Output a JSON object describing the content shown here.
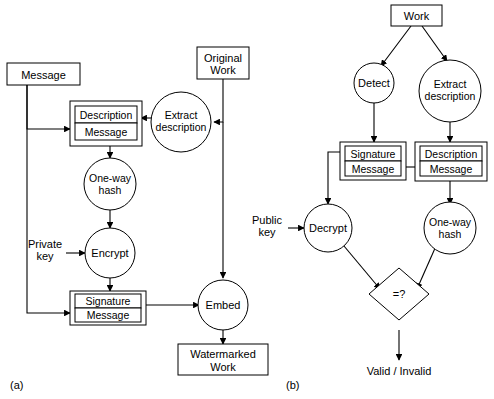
{
  "figure": {
    "title_present": false,
    "background_color": "#ffffff",
    "line_color": "#000000",
    "panels": [
      {
        "id": "a",
        "caption": "(a)",
        "name": "watermark-embedding-diagram",
        "nodes": {
          "message": "Message",
          "original_work": "Original\nWork",
          "original_work_line1": "Original",
          "original_work_line2": "Work",
          "extract_description_line1": "Extract",
          "extract_description_line2": "description",
          "description_message_top": "Description",
          "description_message_bottom": "Message",
          "one_way_hash_line1": "One-way",
          "one_way_hash_line2": "hash",
          "private_key_line1": "Private",
          "private_key_line2": "key",
          "encrypt": "Encrypt",
          "signature_message_top": "Signature",
          "signature_message_bottom": "Message",
          "embed": "Embed",
          "watermarked_work_line1": "Watermarked",
          "watermarked_work_line2": "Work"
        }
      },
      {
        "id": "b",
        "caption": "(b)",
        "name": "watermark-verification-diagram",
        "nodes": {
          "work": "Work",
          "detect": "Detect",
          "extract_description_line1": "Extract",
          "extract_description_line2": "description",
          "signature_message_top": "Signature",
          "signature_message_bottom": "Message",
          "description_message_top": "Description",
          "description_message_bottom": "Message",
          "public_key_line1": "Public",
          "public_key_line2": "key",
          "decrypt": "Decrypt",
          "one_way_hash_line1": "One-way",
          "one_way_hash_line2": "hash",
          "compare": "=?",
          "result": "Valid / Invalid"
        }
      }
    ]
  }
}
